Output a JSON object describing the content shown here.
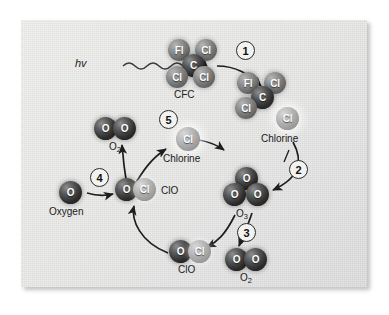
{
  "figure": {
    "light_label": "hv"
  },
  "steps": [
    {
      "id": "step-1",
      "label": "1"
    },
    {
      "id": "step-2",
      "label": "2"
    },
    {
      "id": "step-3",
      "label": "3"
    },
    {
      "id": "step-4",
      "label": "4"
    },
    {
      "id": "step-5",
      "label": "5"
    }
  ],
  "molecules": {
    "cfc": {
      "label": "CFC",
      "atoms": [
        {
          "symbol": "Fl",
          "shade": "mid"
        },
        {
          "symbol": "Cl",
          "shade": "mid"
        },
        {
          "symbol": "C",
          "shade": "dark"
        },
        {
          "symbol": "Cl",
          "shade": "mid"
        },
        {
          "symbol": "Cl",
          "shade": "mid"
        }
      ]
    },
    "cfc_fragment": {
      "label": "",
      "atoms": [
        {
          "symbol": "Fl",
          "shade": "mid"
        },
        {
          "symbol": "Cl",
          "shade": "mid"
        },
        {
          "symbol": "C",
          "shade": "dark"
        },
        {
          "symbol": "Cl",
          "shade": "mid"
        }
      ]
    },
    "chlorine_right": {
      "label": "Chlorine",
      "atoms": [
        {
          "symbol": "Cl",
          "shade": "light"
        }
      ]
    },
    "ozone": {
      "label": "O3",
      "label_base": "O",
      "label_sub": "3",
      "atoms": [
        {
          "symbol": "O",
          "shade": "dark"
        },
        {
          "symbol": "O",
          "shade": "dark"
        },
        {
          "symbol": "O",
          "shade": "dark"
        }
      ]
    },
    "oxygen_o2_lower": {
      "label": "O2",
      "label_base": "O",
      "label_sub": "2",
      "atoms": [
        {
          "symbol": "O",
          "shade": "dark"
        },
        {
          "symbol": "O",
          "shade": "dark"
        }
      ]
    },
    "clo_lower": {
      "label": "ClO",
      "atoms": [
        {
          "symbol": "O",
          "shade": "dark"
        },
        {
          "symbol": "Cl",
          "shade": "light"
        }
      ]
    },
    "clo_middle": {
      "label": "ClO",
      "atoms": [
        {
          "symbol": "O",
          "shade": "dark"
        },
        {
          "symbol": "Cl",
          "shade": "light"
        }
      ]
    },
    "oxygen_atom": {
      "label": "Oxygen",
      "atoms": [
        {
          "symbol": "O",
          "shade": "dark"
        }
      ]
    },
    "oxygen_o2_upper": {
      "label": "O2",
      "label_base": "O",
      "label_sub": "2",
      "atoms": [
        {
          "symbol": "O",
          "shade": "dark"
        },
        {
          "symbol": "O",
          "shade": "dark"
        }
      ]
    },
    "chlorine_middle": {
      "label": "Chlorine",
      "atoms": [
        {
          "symbol": "Cl",
          "shade": "light"
        }
      ]
    }
  },
  "colors": {
    "panel_background": "#e4e4e2",
    "page_background": "#ffffff",
    "atom_dark": "#2e2e2e",
    "atom_light": "#bcbcbc",
    "arrow": "#1e1e1e",
    "text": "#202020"
  }
}
